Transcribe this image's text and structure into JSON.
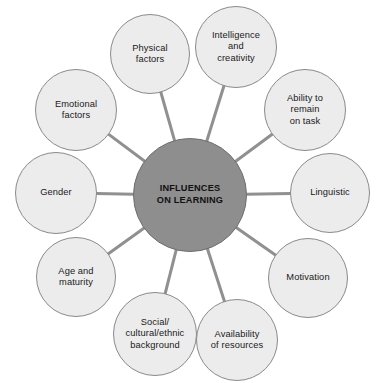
{
  "diagram": {
    "type": "spider-hub-and-spoke",
    "canvas": {
      "width": 380,
      "height": 383,
      "background": "#ffffff"
    },
    "colors": {
      "center_fill": "#8e8e8e",
      "center_stroke": "#6f6f6f",
      "node_fill": "#ececec",
      "node_stroke": "#8a8a8a",
      "edge": "#909090",
      "text": "#1a1a1a"
    },
    "center": {
      "label": "INFLUENCES\nON LEARNING",
      "cx": 190,
      "cy": 195,
      "r": 57
    },
    "nodes": [
      {
        "id": "physical-factors",
        "label": "Physical\nfactors",
        "cx": 150,
        "cy": 54,
        "r": 40
      },
      {
        "id": "intelligence",
        "label": "Intelligence\nand\ncreativity",
        "cx": 236,
        "cy": 47,
        "r": 41
      },
      {
        "id": "ability-remain",
        "label": "Ability to\nremain\non task",
        "cx": 305,
        "cy": 110,
        "r": 41
      },
      {
        "id": "linguistic",
        "label": "Linguistic",
        "cx": 330,
        "cy": 193,
        "r": 40
      },
      {
        "id": "motivation",
        "label": "Motivation",
        "cx": 308,
        "cy": 278,
        "r": 40
      },
      {
        "id": "availability",
        "label": "Availability\nof resources",
        "cx": 237,
        "cy": 340,
        "r": 41
      },
      {
        "id": "social-cultural",
        "label": "Social/\ncultural/ethnic\nbackground",
        "cx": 155,
        "cy": 334,
        "r": 42
      },
      {
        "id": "age-maturity",
        "label": "Age and\nmaturity",
        "cx": 76,
        "cy": 277,
        "r": 40
      },
      {
        "id": "gender",
        "label": "Gender",
        "cx": 56,
        "cy": 193,
        "r": 41
      },
      {
        "id": "emotional-factors",
        "label": "Emotional\nfactors",
        "cx": 76,
        "cy": 110,
        "r": 41
      }
    ],
    "edges": [
      {
        "from": "center",
        "to": "physical-factors"
      },
      {
        "from": "center",
        "to": "intelligence"
      },
      {
        "from": "center",
        "to": "ability-remain"
      },
      {
        "from": "center",
        "to": "linguistic"
      },
      {
        "from": "center",
        "to": "motivation"
      },
      {
        "from": "center",
        "to": "availability"
      },
      {
        "from": "center",
        "to": "social-cultural"
      },
      {
        "from": "center",
        "to": "age-maturity"
      },
      {
        "from": "center",
        "to": "gender"
      },
      {
        "from": "center",
        "to": "emotional-factors"
      }
    ]
  }
}
